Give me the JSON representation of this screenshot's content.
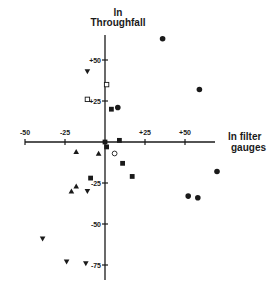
{
  "chart_data": {
    "type": "scatter",
    "title": "",
    "xlabel": "ln filter gauges",
    "ylabel": "ln Throughfall",
    "xlabel_lines": [
      "ln filter",
      "gauges"
    ],
    "ylabel_lines": [
      "ln",
      "Throughfall"
    ],
    "xlim": [
      -50,
      75
    ],
    "ylim": [
      -82,
      70
    ],
    "x_ticks": [
      "-50",
      "-25",
      "+25",
      "+50"
    ],
    "x_tick_values": [
      -50,
      -25,
      25,
      50
    ],
    "y_ticks": [
      "+50",
      "+25",
      "-25",
      "-50",
      "-75"
    ],
    "y_tick_values": [
      50,
      25,
      -25,
      -50,
      -75
    ],
    "grid": false,
    "axes_through_origin": true,
    "legend": "none",
    "series": [
      {
        "name": "filled-circle",
        "marker": "circle-filled",
        "points": [
          [
            36,
            63
          ],
          [
            59,
            32
          ],
          [
            8,
            21
          ],
          [
            70,
            -18
          ],
          [
            52,
            -33
          ],
          [
            58,
            -34
          ]
        ]
      },
      {
        "name": "filled-square",
        "marker": "square-filled",
        "points": [
          [
            4,
            20
          ],
          [
            0,
            0
          ],
          [
            1,
            -3
          ],
          [
            9,
            1
          ],
          [
            11,
            -13
          ],
          [
            17,
            -21
          ],
          [
            -9,
            -22
          ]
        ]
      },
      {
        "name": "open-square",
        "marker": "square-open",
        "points": [
          [
            1,
            35
          ],
          [
            -11,
            26
          ]
        ]
      },
      {
        "name": "open-circle",
        "marker": "circle-open",
        "points": [
          [
            6,
            -7
          ]
        ]
      },
      {
        "name": "up-triangle",
        "marker": "triangle-up",
        "points": [
          [
            -18,
            -6
          ],
          [
            -4,
            -7
          ],
          [
            -18,
            -27
          ],
          [
            -21,
            -30
          ]
        ]
      },
      {
        "name": "down-triangle",
        "marker": "triangle-down",
        "points": [
          [
            -11,
            43
          ],
          [
            -11,
            -30
          ],
          [
            -39,
            -59
          ],
          [
            -24,
            -73
          ],
          [
            -12,
            -74
          ]
        ]
      }
    ]
  },
  "colors": {
    "ink": "#1a1a1a",
    "background": "#ffffff"
  }
}
